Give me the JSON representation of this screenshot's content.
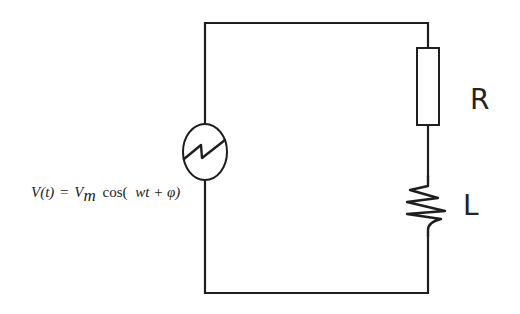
{
  "diagram": {
    "type": "circuit",
    "components": [
      {
        "id": "source",
        "kind": "ac-voltage-source",
        "equation": "V(t) = Vm cos( wt + φ)"
      },
      {
        "id": "resistor",
        "kind": "resistor",
        "label": "R"
      },
      {
        "id": "inductor",
        "kind": "inductor",
        "label": "L"
      }
    ],
    "source_equation": {
      "lhs": "V(t)",
      "equals": "=",
      "amplitude": "V",
      "amplitude_subscript": "m",
      "function": "cos(",
      "argument": "wt + φ)"
    },
    "resistor_label": "R",
    "inductor_label": "L",
    "colors": {
      "line": "#1e1e1e",
      "text": "#222222",
      "background": "#ffffff"
    }
  }
}
